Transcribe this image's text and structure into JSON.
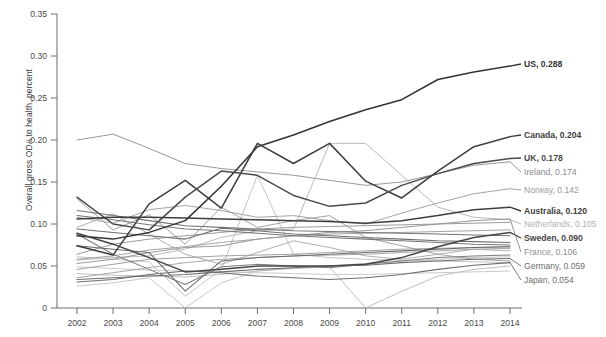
{
  "chart_data": {
    "type": "line",
    "title": "",
    "subtitle": "",
    "xlabel": "",
    "ylabel": "Overall gross ODA to health, percent",
    "x": [
      2002,
      2003,
      2004,
      2005,
      2006,
      2007,
      2008,
      2009,
      2010,
      2011,
      2012,
      2013,
      2014
    ],
    "xtick_labels": [
      "2002",
      "2003",
      "2004",
      "2005",
      "2006",
      "2007",
      "2008",
      "2009",
      "2010",
      "2011",
      "2012",
      "2013",
      "2014"
    ],
    "ytick_labels": [
      "0",
      "0.05",
      "0.10",
      "0.15",
      "0.20",
      "0.25",
      "0.30",
      "0.35"
    ],
    "ytick_values": [
      0,
      0.05,
      0.1,
      0.15,
      0.2,
      0.25,
      0.3,
      0.35
    ],
    "ylim": [
      0,
      0.35
    ],
    "xlim": [
      2002,
      2014
    ],
    "grid": false,
    "legend_position": "right-of-plot-end-labels",
    "series": [
      {
        "name": "US",
        "end_value": 0.288,
        "label": "US, 0.288",
        "emphasis": "strong",
        "color": "#333333",
        "values": [
          0.086,
          0.082,
          0.09,
          0.104,
          0.145,
          0.192,
          0.206,
          0.222,
          0.236,
          0.248,
          0.272,
          0.281,
          0.288
        ]
      },
      {
        "name": "Canada",
        "end_value": 0.204,
        "label": "Canada, 0.204",
        "emphasis": "strong",
        "color": "#3d3d3d",
        "values": [
          0.074,
          0.063,
          0.124,
          0.152,
          0.119,
          0.196,
          0.172,
          0.196,
          0.151,
          0.131,
          0.163,
          0.192,
          0.204
        ]
      },
      {
        "name": "UK",
        "end_value": 0.178,
        "label": "UK, 0.178",
        "emphasis": "strong",
        "color": "#4a4a4a",
        "values": [
          0.132,
          0.1,
          0.093,
          0.132,
          0.163,
          0.158,
          0.134,
          0.121,
          0.125,
          0.146,
          0.16,
          0.172,
          0.178
        ]
      },
      {
        "name": "Ireland",
        "end_value": 0.174,
        "label": "Ireland, 0.174",
        "emphasis": "light",
        "color": "#8c8c8c",
        "values": [
          0.2,
          0.207,
          0.19,
          0.172,
          0.166,
          0.162,
          0.158,
          0.152,
          0.146,
          0.15,
          0.16,
          0.17,
          0.174
        ]
      },
      {
        "name": "Norway",
        "end_value": 0.142,
        "label": "Norway, 0.142",
        "emphasis": "light",
        "color": "#9a9a9a",
        "values": [
          0.108,
          0.101,
          0.117,
          0.122,
          0.116,
          0.108,
          0.11,
          0.104,
          0.1,
          0.113,
          0.125,
          0.136,
          0.142
        ]
      },
      {
        "name": "Australia",
        "end_value": 0.12,
        "label": "Australia, 0.120",
        "emphasis": "strong",
        "color": "#3d3d3d",
        "values": [
          0.106,
          0.108,
          0.108,
          0.107,
          0.106,
          0.105,
          0.104,
          0.103,
          0.101,
          0.104,
          0.11,
          0.117,
          0.12
        ]
      },
      {
        "name": "Netherlands",
        "end_value": 0.105,
        "label": "Netherlands, 0.105",
        "emphasis": "lighter",
        "color": "#b2b2b2",
        "values": [
          0.057,
          0.06,
          0.062,
          0.07,
          0.084,
          0.092,
          0.094,
          0.196,
          0.196,
          0.158,
          0.12,
          0.108,
          0.105
        ]
      },
      {
        "name": "Sweden",
        "end_value": 0.09,
        "label": "Sweden, 0.090",
        "emphasis": "strong",
        "color": "#454545",
        "values": [
          0.089,
          0.076,
          0.06,
          0.043,
          0.046,
          0.05,
          0.05,
          0.05,
          0.052,
          0.06,
          0.073,
          0.084,
          0.09
        ]
      },
      {
        "name": "France",
        "end_value": 0.106,
        "label": "France, 0.106",
        "emphasis": "light",
        "color": "#8c8c8c",
        "values": [
          0.053,
          0.058,
          0.066,
          0.072,
          0.074,
          0.082,
          0.086,
          0.09,
          0.092,
          0.096,
          0.1,
          0.104,
          0.106
        ]
      },
      {
        "name": "Germany",
        "end_value": 0.059,
        "label": "Germany, 0.059",
        "emphasis": "medium",
        "color": "#6e6e6e",
        "values": [
          0.034,
          0.036,
          0.038,
          0.04,
          0.043,
          0.046,
          0.048,
          0.05,
          0.051,
          0.054,
          0.056,
          0.058,
          0.059
        ]
      },
      {
        "name": "Japan",
        "end_value": 0.054,
        "label": "Japan, 0.054",
        "emphasis": "medium",
        "color": "#6e6e6e",
        "values": [
          0.031,
          0.034,
          0.04,
          0.044,
          0.042,
          0.038,
          0.036,
          0.034,
          0.036,
          0.04,
          0.046,
          0.051,
          0.054
        ]
      },
      {
        "name": "other-1",
        "end_value": null,
        "label": "",
        "emphasis": "light",
        "color": "#9a9a9a",
        "values": [
          0.13,
          0.093,
          0.111,
          0.076,
          0.12,
          0.096,
          0.104,
          0.11,
          0.084,
          0.074,
          0.064,
          0.058,
          0.056
        ]
      },
      {
        "name": "other-2",
        "end_value": null,
        "label": "",
        "emphasis": "light",
        "color": "#a5a5a5",
        "values": [
          0.096,
          0.112,
          0.088,
          0.064,
          0.052,
          0.066,
          0.08,
          0.072,
          0.062,
          0.058,
          0.064,
          0.07,
          0.068
        ]
      },
      {
        "name": "other-3",
        "end_value": null,
        "label": "",
        "emphasis": "medium",
        "color": "#777777",
        "values": [
          0.11,
          0.105,
          0.099,
          0.094,
          0.092,
          0.089,
          0.086,
          0.084,
          0.082,
          0.08,
          0.078,
          0.076,
          0.075
        ]
      },
      {
        "name": "other-4",
        "end_value": null,
        "label": "",
        "emphasis": "lighter",
        "color": "#bdbdbd",
        "values": [
          0.061,
          0.058,
          0.055,
          0.014,
          0.046,
          0.158,
          0.064,
          0.06,
          0.058,
          0.057,
          0.056,
          0.055,
          0.054
        ]
      },
      {
        "name": "other-5",
        "end_value": null,
        "label": "",
        "emphasis": "medium",
        "color": "#7d7d7d",
        "values": [
          0.088,
          0.064,
          0.046,
          0.028,
          0.049,
          0.052,
          0.05,
          0.048,
          0.052,
          0.056,
          0.06,
          0.062,
          0.063
        ]
      },
      {
        "name": "other-6",
        "end_value": null,
        "label": "",
        "emphasis": "light",
        "color": "#959595",
        "values": [
          0.046,
          0.052,
          0.058,
          0.06,
          0.062,
          0.063,
          0.064,
          0.066,
          0.068,
          0.07,
          0.071,
          0.072,
          0.073
        ]
      },
      {
        "name": "other-7",
        "end_value": null,
        "label": "",
        "emphasis": "lighter",
        "color": "#c0c0c0",
        "values": [
          0.026,
          0.03,
          0.036,
          0.0,
          0.03,
          0.044,
          0.048,
          0.05,
          0.053,
          0.056,
          0.058,
          0.06,
          0.061
        ]
      },
      {
        "name": "other-8",
        "end_value": null,
        "label": "",
        "emphasis": "medium",
        "color": "#707070",
        "values": [
          0.094,
          0.09,
          0.086,
          0.082,
          0.095,
          0.092,
          0.088,
          0.086,
          0.084,
          0.082,
          0.08,
          0.079,
          0.078
        ]
      },
      {
        "name": "other-9",
        "end_value": null,
        "label": "",
        "emphasis": "light",
        "color": "#989898",
        "values": [
          0.058,
          0.062,
          0.069,
          0.073,
          0.078,
          0.082,
          0.086,
          0.088,
          0.089,
          0.09,
          0.091,
          0.092,
          0.093
        ]
      },
      {
        "name": "other-10",
        "end_value": null,
        "label": "",
        "emphasis": "lighter",
        "color": "#b8b8b8",
        "values": [
          0.041,
          0.039,
          0.038,
          0.037,
          0.04,
          0.044,
          0.047,
          0.049,
          0.0,
          0.02,
          0.038,
          0.046,
          0.05
        ]
      },
      {
        "name": "other-11",
        "end_value": null,
        "label": "",
        "emphasis": "medium",
        "color": "#6a6a6a",
        "values": [
          0.074,
          0.07,
          0.066,
          0.02,
          0.056,
          0.06,
          0.062,
          0.064,
          0.066,
          0.068,
          0.07,
          0.072,
          0.073
        ]
      },
      {
        "name": "other-12",
        "end_value": null,
        "label": "",
        "emphasis": "light",
        "color": "#909090",
        "values": [
          0.064,
          0.076,
          0.082,
          0.086,
          0.09,
          0.094,
          0.096,
          0.097,
          0.098,
          0.099,
          0.1,
          0.101,
          0.102
        ]
      },
      {
        "name": "other-13",
        "end_value": null,
        "label": "",
        "emphasis": "lighter",
        "color": "#c4c4c4",
        "values": [
          0.049,
          0.047,
          0.045,
          0.044,
          0.043,
          0.042,
          0.041,
          0.04,
          0.04,
          0.041,
          0.042,
          0.043,
          0.044
        ]
      },
      {
        "name": "other-14",
        "end_value": null,
        "label": "",
        "emphasis": "medium",
        "color": "#747474",
        "values": [
          0.116,
          0.11,
          0.104,
          0.098,
          0.096,
          0.094,
          0.092,
          0.091,
          0.09,
          0.089,
          0.088,
          0.087,
          0.086
        ]
      },
      {
        "name": "other-15",
        "end_value": null,
        "label": "",
        "emphasis": "light",
        "color": "#9e9e9e",
        "values": [
          0.036,
          0.042,
          0.048,
          0.054,
          0.058,
          0.06,
          0.062,
          0.063,
          0.064,
          0.066,
          0.068,
          0.07,
          0.071
        ]
      }
    ]
  },
  "axis": {
    "y_title": "Overall gross ODA to health, percent"
  }
}
